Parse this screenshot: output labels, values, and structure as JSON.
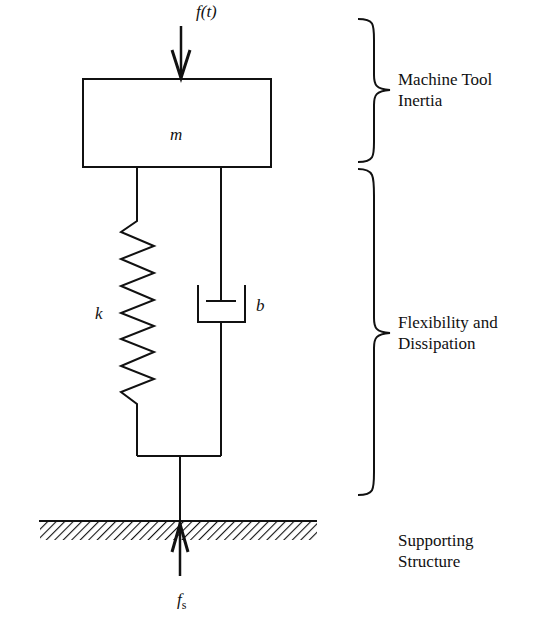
{
  "diagram": {
    "type": "mass-spring-damper model",
    "mass_label": "m",
    "spring_label": "k",
    "damper_label": "b",
    "input_force_label": "f(t)",
    "support_force_label_base": "f",
    "support_force_label_sub": "s",
    "annotations": [
      {
        "line1": "Machine Tool",
        "line2": "Inertia"
      },
      {
        "line1": "Flexibility and",
        "line2": "Dissipation"
      },
      {
        "line1": "Supporting",
        "line2": "Structure"
      }
    ],
    "colors": {
      "stroke": "#111111",
      "background": "#ffffff"
    }
  }
}
